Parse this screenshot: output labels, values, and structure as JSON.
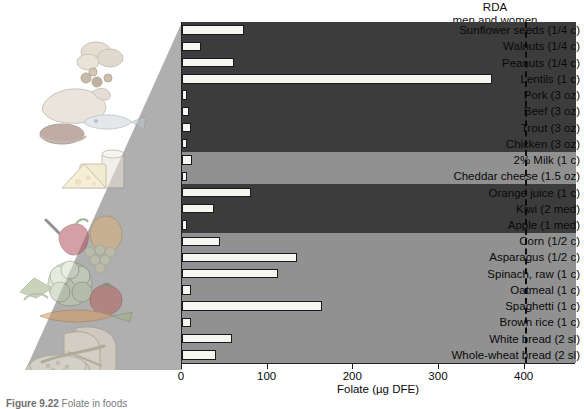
{
  "figure": {
    "rda_label_line1": "RDA",
    "rda_label_line2": "men and women",
    "caption_label": "Figure 9.22",
    "caption_text": "Folate in foods"
  },
  "axis": {
    "x_title": "Folate (µg DFE)",
    "x_ticks": [
      0,
      100,
      200,
      300,
      400
    ],
    "x_min": 0,
    "x_max": 460,
    "rda_value": 400
  },
  "colors": {
    "band_dark": "#3c3c3c",
    "band_light": "#919191",
    "bar_fill": "#f7f7f2",
    "bar_stroke": "#1a1a1a",
    "rda_line": "#0d0d0d",
    "wedge": "#a8a8a8"
  },
  "chart_data": {
    "type": "bar",
    "title": "Folate in foods",
    "xlabel": "Folate (µg DFE)",
    "ylabel": "",
    "xlim": [
      0,
      460
    ],
    "grid": false,
    "orientation": "horizontal",
    "legend": "none",
    "annotations": [
      {
        "text": "RDA men and women",
        "value": 400,
        "style": "dashed-vertical-line"
      }
    ],
    "categories": [
      "Sunflower seeds (1/4 c)",
      "Walnuts (1/4 c)",
      "Peanuts (1/4 c)",
      "Lentils (1 c)",
      "Pork (3 oz)",
      "Beef (3 oz)",
      "Trout (3 oz)",
      "Chicken (3 oz)",
      "2% Milk (1 c)",
      "Cheddar cheese (1.5 oz)",
      "Orange juice (1 c)",
      "Kiwi (2 med)",
      "Apple (1 med)",
      "Corn (1/2 c)",
      "Asparagus (1/2 c)",
      "Spinach, raw (1 c)",
      "Oatmeal (1 c)",
      "Spaghetti (1 c)",
      "Brown rice (1 c)",
      "White bread (2 sl)",
      "Whole-wheat bread (2 sl)"
    ],
    "values": [
      72,
      22,
      61,
      362,
      6,
      8,
      10,
      5,
      12,
      6,
      80,
      37,
      5,
      44,
      134,
      112,
      10,
      164,
      10,
      58,
      40
    ],
    "groups": [
      {
        "name": "nuts-legumes",
        "rows": [
          0,
          1,
          2,
          3
        ],
        "shade": "dark"
      },
      {
        "name": "meats",
        "rows": [
          4,
          5,
          6,
          7
        ],
        "shade": "dark"
      },
      {
        "name": "dairy",
        "rows": [
          8,
          9
        ],
        "shade": "light"
      },
      {
        "name": "fruits",
        "rows": [
          10,
          11,
          12
        ],
        "shade": "dark"
      },
      {
        "name": "vegetables",
        "rows": [
          13,
          14,
          15
        ],
        "shade": "light"
      },
      {
        "name": "grains",
        "rows": [
          16,
          17,
          18,
          19,
          20
        ],
        "shade": "light"
      }
    ]
  }
}
